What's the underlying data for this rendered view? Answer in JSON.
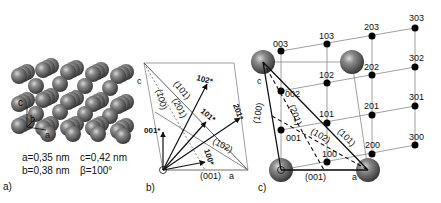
{
  "panel_a": {
    "label": "a)",
    "axes": {
      "c": "c",
      "b": "b",
      "a": "a"
    },
    "params": {
      "line1_left": "a=0,35 nm",
      "line1_right": "c=0,42 nm",
      "line2_left": "b=0,38 nm",
      "line2_right": "β=100°"
    }
  },
  "panel_b": {
    "label": "b)",
    "axis_c": "c",
    "axis_a": "a",
    "planes": [
      "(101)",
      "(201)",
      "(100)",
      "(102)",
      "(001)"
    ],
    "vectors": [
      "102*",
      "101*",
      "201*",
      "001*",
      "100*"
    ]
  },
  "panel_c": {
    "label": "c)",
    "axis_c": "c",
    "axis_a": "a",
    "planes": [
      "(100)",
      "(201)",
      "(102)",
      "(101)",
      "(001)"
    ],
    "nodes": [
      "003",
      "103",
      "203",
      "303",
      "002",
      "102",
      "202",
      "302",
      "001",
      "101",
      "201",
      "301",
      "100",
      "200",
      "300"
    ]
  },
  "colors": {
    "sphere": "#6b6b6b",
    "sphere_highlight": "#c8c8c8",
    "line": "#111111",
    "grid": "#999999"
  }
}
